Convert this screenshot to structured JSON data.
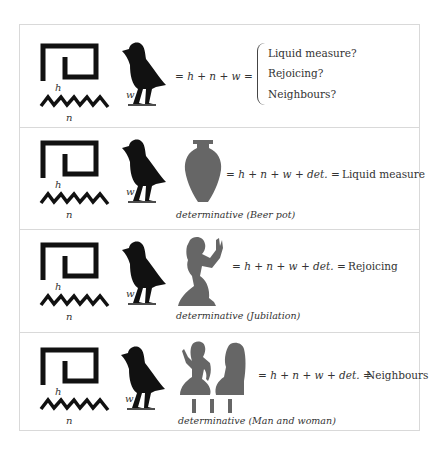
{
  "rows": [
    {
      "h_label": "h",
      "n_label": "n",
      "w_label": "w",
      "equation": "= h + n + w =",
      "meanings": [
        "Liquid measure?",
        "Rejoicing?",
        "Neighbours?"
      ]
    },
    {
      "h_label": "h",
      "n_label": "n",
      "w_label": "w",
      "determinative_icon": "beer-pot-icon",
      "equation": "= h + n + w + det. =",
      "meaning": "Liquid measure",
      "caption": "determinative (Beer pot)"
    },
    {
      "h_label": "h",
      "n_label": "n",
      "w_label": "w",
      "determinative_icon": "jubilation-figure-icon",
      "equation": "= h + n + w + det. =",
      "meaning": "Rejoicing",
      "caption": "determinative (Jubilation)"
    },
    {
      "h_label": "h",
      "n_label": "n",
      "w_label": "w",
      "determinative_icon": "man-and-woman-icon",
      "equation": "= h + n + w + det. =",
      "meaning": "Neighbours",
      "caption": "determinative (Man and woman)"
    }
  ],
  "colors": {
    "glyph": "#111111",
    "determinative": "#666666",
    "border": "#d9d9d9"
  }
}
